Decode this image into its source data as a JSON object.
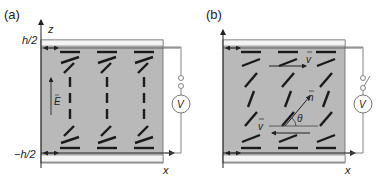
{
  "colors": {
    "cell_fill": "#b9b9b9",
    "plate_fill": "#f4f4f4",
    "frame": "#555555",
    "molecule": "#1a1a1a",
    "wire": "#666666",
    "text": "#222222"
  },
  "panels": [
    {
      "id": "a",
      "label": "(a)",
      "z_axis_label": "z",
      "x_axis_label": "x",
      "top_boundary_label": "h/2",
      "bottom_boundary_label": "−h/2",
      "field_label": "E",
      "meter_label": "V",
      "circuit_state": "closed contacts (field on)",
      "director_configuration": "homeotropic in bulk, planar anchoring at plates (field-aligned)"
    },
    {
      "id": "b",
      "label": "(b)",
      "x_axis_label": "x",
      "flow_top_label": "v",
      "flow_bottom_label": "v",
      "director_label": "n",
      "angle_label": "θ",
      "meter_label": "V",
      "circuit_state": "open switch (field off)",
      "director_configuration": "tilted director under shear flow"
    }
  ]
}
